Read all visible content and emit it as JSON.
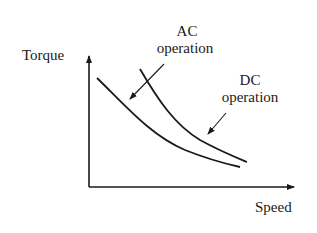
{
  "diagram": {
    "y_axis_label": "Torque",
    "x_axis_label": "Speed",
    "curves": [
      {
        "name": "AC operation",
        "label_line1": "AC",
        "label_line2": "operation"
      },
      {
        "name": "DC operation",
        "label_line1": "DC",
        "label_line2": "operation"
      }
    ]
  },
  "colors": {
    "ink": "#1a1a1a",
    "background": "#ffffff"
  }
}
